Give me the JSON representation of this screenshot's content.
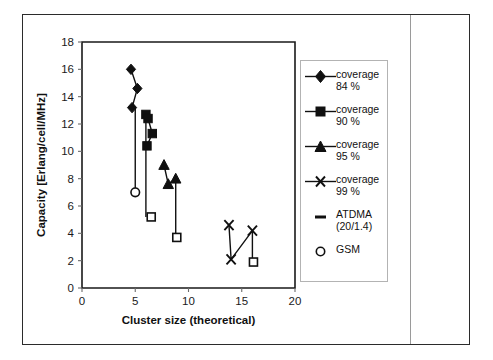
{
  "chart_data": {
    "type": "scatter",
    "title": "",
    "xlabel": "Cluster size (theoretical)",
    "ylabel": "Capacity [Erlang/cell/MHz]",
    "xlim": [
      0,
      20
    ],
    "ylim": [
      0,
      18
    ],
    "xticks": [
      0,
      5,
      10,
      15,
      20
    ],
    "yticks": [
      0,
      2,
      4,
      6,
      8,
      10,
      12,
      14,
      16,
      18
    ],
    "grid": false,
    "legend_position": "right",
    "series": [
      {
        "name": "coverage 84 %",
        "marker": "diamond",
        "connected": true,
        "points": [
          [
            4.6,
            16.0
          ],
          [
            5.2,
            14.6
          ],
          [
            4.7,
            13.2
          ]
        ]
      },
      {
        "name": "coverage 90 %",
        "marker": "square",
        "connected": true,
        "points": [
          [
            6.0,
            12.7
          ],
          [
            6.2,
            12.4
          ],
          [
            6.6,
            11.3
          ],
          [
            6.1,
            10.4
          ]
        ]
      },
      {
        "name": "coverage 95 %",
        "marker": "triangle",
        "connected": true,
        "points": [
          [
            7.7,
            9.0
          ],
          [
            8.1,
            7.6
          ],
          [
            8.8,
            8.0
          ]
        ]
      },
      {
        "name": "coverage 99 %",
        "marker": "cross",
        "connected": true,
        "points": [
          [
            13.8,
            4.6
          ],
          [
            14.0,
            2.1
          ],
          [
            16.0,
            4.2
          ]
        ]
      },
      {
        "name": "ATDMA (20/1.4)",
        "marker": "open-square",
        "connected": false,
        "points": [
          [
            6.5,
            5.2
          ],
          [
            8.9,
            3.7
          ],
          [
            16.1,
            1.9
          ]
        ]
      },
      {
        "name": "GSM",
        "marker": "open-circle",
        "connected": false,
        "points": [
          [
            5.0,
            7.0
          ]
        ]
      }
    ],
    "droplines": [
      {
        "x": 6.0,
        "y_top": 12.7,
        "y_bottom": 5.2
      },
      {
        "x": 8.8,
        "y_top": 8.0,
        "y_bottom": 3.7
      },
      {
        "x": 16.0,
        "y_top": 4.2,
        "y_bottom": 1.9
      },
      {
        "x": 5.0,
        "y_top": 13.2,
        "y_bottom": 7.0
      }
    ]
  },
  "legend": {
    "items": [
      {
        "label_line1": "coverage",
        "label_line2": "84 %",
        "marker": "diamond"
      },
      {
        "label_line1": "coverage",
        "label_line2": "90 %",
        "marker": "square"
      },
      {
        "label_line1": "coverage",
        "label_line2": "95 %",
        "marker": "triangle"
      },
      {
        "label_line1": "coverage",
        "label_line2": "99 %",
        "marker": "cross"
      },
      {
        "label_line1": "ATDMA",
        "label_line2": "(20/1.4)",
        "marker": "dash"
      },
      {
        "label_line1": "GSM",
        "label_line2": "",
        "marker": "open-circle"
      }
    ]
  }
}
